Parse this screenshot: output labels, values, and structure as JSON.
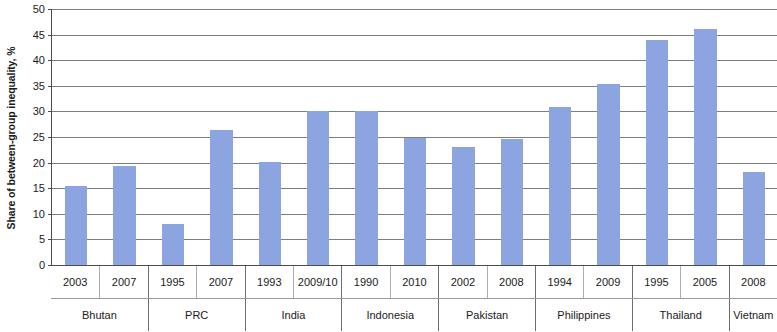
{
  "chart_data": {
    "type": "bar",
    "title": "",
    "subtitle": "",
    "xlabel": "",
    "ylabel": "Share of between-group inequality, %",
    "ylim": [
      0,
      50
    ],
    "ytick_step": 5,
    "yticks": [
      "50",
      "45",
      "40",
      "35",
      "30",
      "25",
      "20",
      "15",
      "10",
      "5",
      "0"
    ],
    "grid": true,
    "legend": "none",
    "bar_color": "#8ca4e0",
    "categories": [
      "2003",
      "2007",
      "1995",
      "2007",
      "1993",
      "2009/10",
      "1990",
      "2010",
      "2002",
      "2008",
      "1994",
      "2009",
      "1995",
      "2005",
      "2008"
    ],
    "values": [
      15.5,
      19.3,
      8.0,
      26.3,
      20.2,
      30.0,
      30.0,
      24.9,
      23.0,
      24.6,
      30.8,
      35.3,
      44.0,
      46.0,
      18.2
    ],
    "groups": [
      {
        "label": "Bhutan",
        "span": 2
      },
      {
        "label": "PRC",
        "span": 2
      },
      {
        "label": "India",
        "span": 2
      },
      {
        "label": "Indonesia",
        "span": 2
      },
      {
        "label": "Pakistan",
        "span": 2
      },
      {
        "label": "Philippines",
        "span": 2
      },
      {
        "label": "Thailand",
        "span": 2
      },
      {
        "label": "Vietnam",
        "span": 1
      }
    ],
    "series": [
      {
        "name": "Share of between-group inequality",
        "values": [
          15.5,
          19.3,
          8.0,
          26.3,
          20.2,
          30.0,
          30.0,
          24.9,
          23.0,
          24.6,
          30.8,
          35.3,
          44.0,
          46.0,
          18.2
        ]
      }
    ],
    "points": [
      {
        "country": "Bhutan",
        "year": "2003",
        "value": 15.5
      },
      {
        "country": "Bhutan",
        "year": "2007",
        "value": 19.3
      },
      {
        "country": "PRC",
        "year": "1995",
        "value": 8.0
      },
      {
        "country": "PRC",
        "year": "2007",
        "value": 26.3
      },
      {
        "country": "India",
        "year": "1993",
        "value": 20.2
      },
      {
        "country": "India",
        "year": "2009/10",
        "value": 30.0
      },
      {
        "country": "Indonesia",
        "year": "1990",
        "value": 30.0
      },
      {
        "country": "Indonesia",
        "year": "2010",
        "value": 24.9
      },
      {
        "country": "Pakistan",
        "year": "2002",
        "value": 23.0
      },
      {
        "country": "Pakistan",
        "year": "2008",
        "value": 24.6
      },
      {
        "country": "Philippines",
        "year": "1994",
        "value": 30.8
      },
      {
        "country": "Philippines",
        "year": "2009",
        "value": 35.3
      },
      {
        "country": "Thailand",
        "year": "1995",
        "value": 44.0
      },
      {
        "country": "Thailand",
        "year": "2005",
        "value": 46.0
      },
      {
        "country": "Vietnam",
        "year": "2008",
        "value": 18.2
      }
    ]
  }
}
